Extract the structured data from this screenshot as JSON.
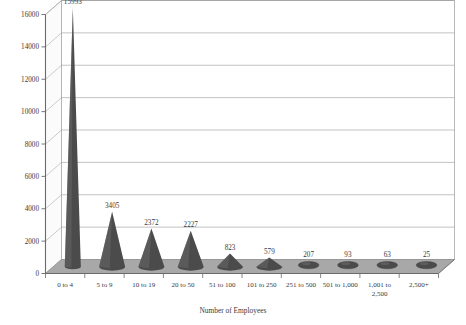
{
  "chart_data": {
    "type": "bar",
    "title": "",
    "subtitle": "",
    "xlabel": "Number of Employees",
    "ylabel": "",
    "categories": [
      "0 to 4",
      "5 to 9",
      "10 to 19",
      "20 to 50",
      "51 to 100",
      "101 to 250",
      "251 to 500",
      "501 to 1,000",
      "1,001 to 2,500",
      "2,500+"
    ],
    "category_lines": [
      [
        "0 to 4"
      ],
      [
        "5 to 9"
      ],
      [
        "10 to 19"
      ],
      [
        "20 to 50"
      ],
      [
        "51 to 100"
      ],
      [
        "101 to 250"
      ],
      [
        "251 to 500"
      ],
      [
        "501 to 1,000"
      ],
      [
        "1,001 to",
        "2,500"
      ],
      [
        "2,500+"
      ]
    ],
    "values": [
      15993,
      3405,
      2372,
      2227,
      823,
      579,
      207,
      93,
      63,
      25
    ],
    "data_labels": [
      "15993",
      "3405",
      "2372",
      "2227",
      "823",
      "579",
      "207",
      "93",
      "63",
      "25"
    ],
    "ylim": [
      0,
      16000
    ],
    "yticks": [
      0,
      2000,
      4000,
      6000,
      8000,
      10000,
      12000,
      14000,
      16000
    ],
    "ytick_labels": [
      "0",
      "2000",
      "4000",
      "6000",
      "8000",
      "10000",
      "12000",
      "14000",
      "16000"
    ],
    "grid": true,
    "grid_axis": "y",
    "legend": false,
    "legend_position": "none",
    "style": "3d-cone",
    "colors": {
      "bar": "#4b4b4b",
      "bar_light": "#6d6d6d",
      "floor": "#a8a8a8",
      "floor_edge": "#8f8f8f",
      "sidewall": "#fbfbfb",
      "gridline": "#9a9a9a",
      "axis": "#6a6a6a",
      "text": "#3a3a3a",
      "background": "#ffffff"
    }
  }
}
